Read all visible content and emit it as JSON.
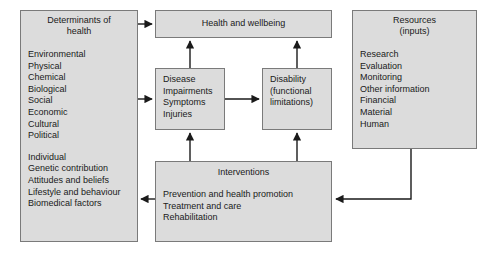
{
  "diagram": {
    "palette": {
      "box_fill": "#dcdcdc",
      "box_border": "#7a7a7a",
      "arrow": "#1a1a1a",
      "background": "#ffffff",
      "text": "#1a1a1a"
    },
    "boxes": {
      "determinants": {
        "title": "Determinants of\nhealth",
        "group_one": "Environmental\nPhysical\nChemical\nBiological\nSocial\nEconomic\nCultural\nPolitical",
        "group_two": "Individual\nGenetic contribution\nAttitudes and beliefs\nLifestyle and behaviour\nBiomedical factors"
      },
      "health": {
        "title": "Health and wellbeing"
      },
      "disease": {
        "body": "Disease\nImpairments\nSymptoms\nInjuries"
      },
      "disability": {
        "body": "Disability\n(functional\nlimitations)"
      },
      "resources": {
        "title": "Resources\n(inputs)",
        "body": "Research\nEvaluation\nMonitoring\nOther information\nFinancial\nMaterial\nHuman"
      },
      "interventions": {
        "title": "Interventions",
        "body": "Prevention and health promotion\nTreatment and care\nRehabilitation"
      }
    },
    "connections": [
      {
        "name": "determinants-to-health",
        "from": "determinants",
        "to": "health",
        "direction": "right"
      },
      {
        "name": "determinants-to-disease",
        "from": "determinants",
        "to": "disease",
        "direction": "right"
      },
      {
        "name": "disease-to-disability",
        "from": "disease",
        "to": "disability",
        "direction": "right"
      },
      {
        "name": "disease-to-health",
        "from": "disease",
        "to": "health",
        "direction": "up"
      },
      {
        "name": "disability-to-health",
        "from": "disability",
        "to": "health",
        "direction": "up"
      },
      {
        "name": "interventions-to-disease",
        "from": "interventions",
        "to": "disease",
        "direction": "up"
      },
      {
        "name": "interventions-to-disability",
        "from": "interventions",
        "to": "disability",
        "direction": "up"
      },
      {
        "name": "interventions-to-determinants",
        "from": "interventions",
        "to": "determinants",
        "direction": "left"
      },
      {
        "name": "resources-to-interventions",
        "from": "resources",
        "to": "interventions",
        "direction": "left-elbow"
      }
    ]
  }
}
